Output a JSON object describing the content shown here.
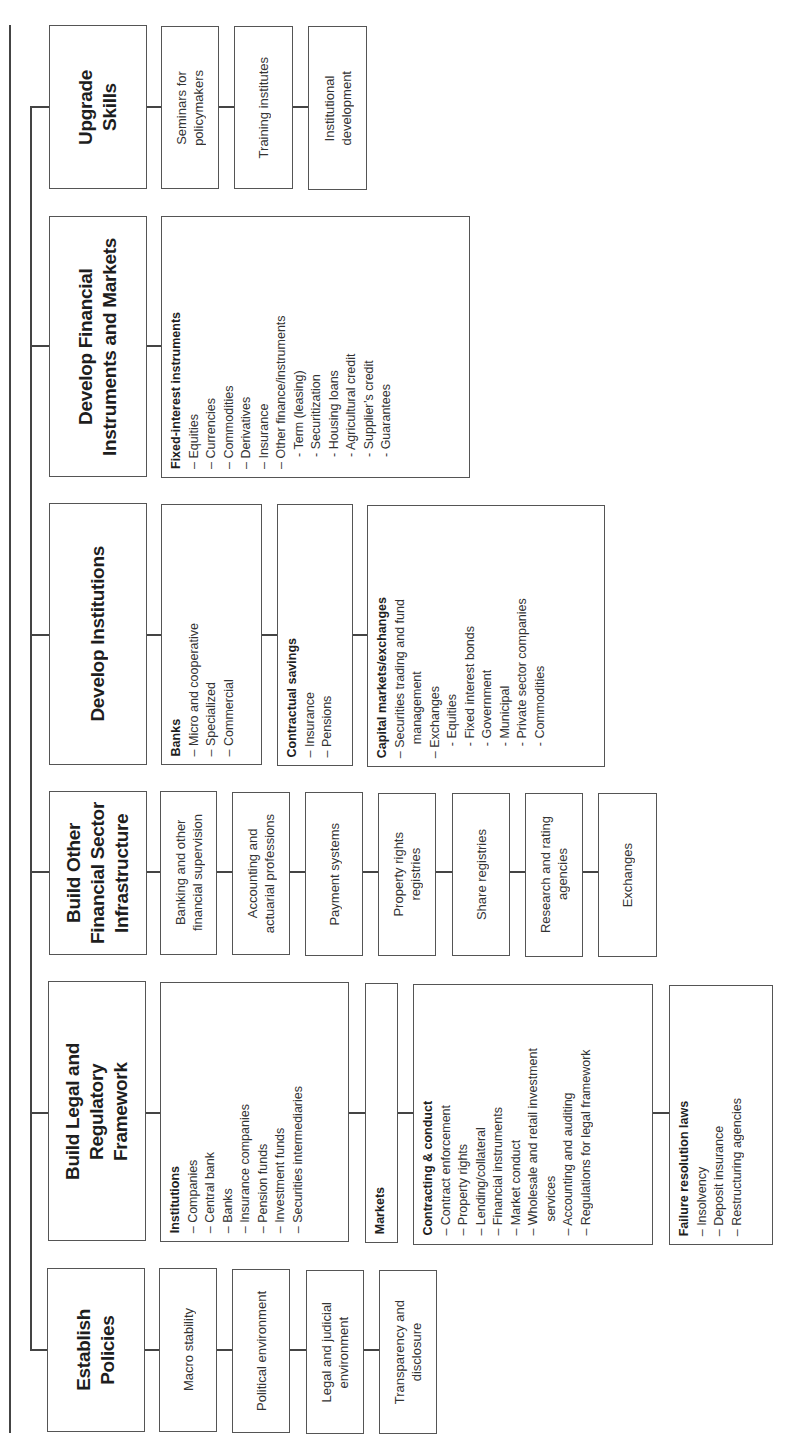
{
  "diagram": {
    "orientation": "rotated-90-ccw",
    "branches": [
      {
        "id": "upgrade-skills",
        "title": "Upgrade Skills",
        "title_lines": [
          "Upgrade",
          "Skills"
        ],
        "children": [
          {
            "label": "Seminars for policymakers",
            "lines": [
              "Seminars for",
              "policymakers"
            ]
          },
          {
            "label": "Training institutes",
            "lines": [
              "Training institutes"
            ]
          },
          {
            "label": "Institutional development",
            "lines": [
              "Institutional",
              "development"
            ]
          }
        ]
      },
      {
        "id": "develop-financial-instruments",
        "title": "Develop Financial Instruments and Markets",
        "title_lines": [
          "Develop Financial",
          "Instruments and Markets"
        ],
        "children": [
          {
            "heading": "Fixed-interest instruments",
            "items": [
              "– Equities",
              "– Currencies",
              "– Commodities",
              "– Derivatives",
              "– Insurance",
              "– Other finance/instruments",
              "- Term (leasing)",
              "- Securitization",
              "- Housing loans",
              "- Agricultural credit",
              "- Supplier’s credit",
              "- Guarantees"
            ]
          }
        ]
      },
      {
        "id": "develop-institutions",
        "title": "Develop Institutions",
        "title_lines": [
          "Develop Institutions"
        ],
        "children": [
          {
            "heading": "Banks",
            "items": [
              "– Micro and cooperative",
              "– Specialized",
              "– Commercial"
            ]
          },
          {
            "heading": "Contractual savings",
            "items": [
              "– Insurance",
              "– Pensions"
            ]
          },
          {
            "heading": "Capital markets/exchanges",
            "items": [
              "– Securities trading and fund",
              "management",
              "– Exchanges",
              "- Equities",
              "- Fixed interest bonds",
              "- Government",
              "- Municipal",
              "- Private sector companies",
              "- Commodities"
            ]
          }
        ]
      },
      {
        "id": "build-other-infrastructure",
        "title": "Build Other Financial Sector Infrastructure",
        "title_lines": [
          "Build Other",
          "Financial Sector",
          "Infrastructure"
        ],
        "children": [
          {
            "label": "Banking and other financial supervision",
            "lines": [
              "Banking and other",
              "financial supervision"
            ]
          },
          {
            "label": "Accounting and actuarial professions",
            "lines": [
              "Accounting and",
              "actuarial professions"
            ]
          },
          {
            "label": "Payment systems",
            "lines": [
              "Payment systems"
            ]
          },
          {
            "label": "Property rights registries",
            "lines": [
              "Property rights",
              "registries"
            ]
          },
          {
            "label": "Share registries",
            "lines": [
              "Share registries"
            ]
          },
          {
            "label": "Research and rating agencies",
            "lines": [
              "Research and rating",
              "agencies"
            ]
          },
          {
            "label": "Exchanges",
            "lines": [
              "Exchanges"
            ]
          }
        ]
      },
      {
        "id": "build-legal-framework",
        "title": "Build Legal and Regulatory Framework",
        "title_lines": [
          "Build Legal and",
          "Regulatory",
          "Framework"
        ],
        "children": [
          {
            "heading": "Institutions",
            "items": [
              "– Companies",
              "– Central bank",
              "– Banks",
              "– Insurance companies",
              "– Pension funds",
              "– Investment funds",
              "– Securities intermediaries"
            ]
          },
          {
            "heading": "Markets",
            "items": []
          },
          {
            "heading": "Contracting & conduct",
            "items": [
              "– Contract enforcement",
              "– Property rights",
              "– Lending/collateral",
              "– Financial instruments",
              "– Market conduct",
              "– Wholesale and retail investment",
              "services",
              "– Accounting and auditing",
              "– Regulations for legal framework"
            ]
          },
          {
            "heading": "Failure resolution laws",
            "items": [
              "– Insolvency",
              "– Deposit insurance",
              "– Restructuring agencies"
            ]
          }
        ]
      },
      {
        "id": "establish-policies",
        "title": "Establish Policies",
        "title_lines": [
          "Establish",
          "Policies"
        ],
        "children": [
          {
            "label": "Macro stability",
            "lines": [
              "Macro stability"
            ]
          },
          {
            "label": "Political environment",
            "lines": [
              "Political environment"
            ]
          },
          {
            "label": "Legal and judicial environment",
            "lines": [
              "Legal and judicial",
              "environment"
            ]
          },
          {
            "label": "Transparency and disclosure",
            "lines": [
              "Transparency and",
              "disclosure"
            ]
          }
        ]
      }
    ]
  },
  "colors": {
    "line": "#444444",
    "border": "#555555",
    "text": "#2a2a2a",
    "background": "#ffffff"
  }
}
